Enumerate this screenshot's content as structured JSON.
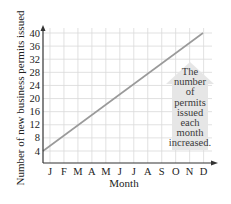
{
  "chart_data": {
    "type": "line",
    "title": "",
    "xlabel": "Month",
    "ylabel": "Number of new business permits issued",
    "categories": [
      "J",
      "F",
      "M",
      "A",
      "M",
      "J",
      "J",
      "A",
      "S",
      "O",
      "N",
      "D"
    ],
    "y_ticks": [
      4,
      8,
      12,
      16,
      20,
      24,
      28,
      32,
      36,
      40
    ],
    "ylim": [
      0,
      42
    ],
    "grid": true,
    "legend": null,
    "series": [
      {
        "name": "Permits issued",
        "x": [
          0,
          12
        ],
        "values": [
          4,
          40
        ],
        "description": "Straight line rising from 4 at the y-axis to 40 at December"
      }
    ],
    "annotation": {
      "text_lines": [
        "The",
        "number",
        "of",
        "permits",
        "issued",
        "each",
        "month",
        "increased."
      ],
      "shape": "upward-arrow",
      "fill": "#e6e6e6"
    },
    "colors": {
      "line": "#9a9a9a",
      "grid": "#d9d9d9",
      "axis": "#333333"
    }
  }
}
